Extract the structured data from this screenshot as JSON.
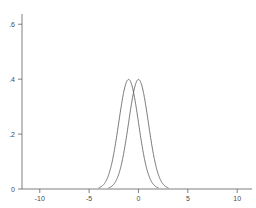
{
  "chart_data": {
    "type": "line",
    "title": "",
    "subtitle": "",
    "xlabel": "",
    "ylabel": "",
    "xlim": [
      -11.8,
      11.5
    ],
    "ylim": [
      0,
      0.63
    ],
    "grid": false,
    "legend_position": "none",
    "x_ticks": [
      -10,
      -5,
      0,
      5,
      10
    ],
    "x_tick_labels": [
      "-10",
      "-5",
      "0",
      "5",
      "10"
    ],
    "y_ticks": [
      0,
      0.2,
      0.4,
      0.6
    ],
    "y_tick_labels": [
      "0",
      ".2",
      ".4",
      ".6"
    ],
    "line_color": "#555555",
    "axis_color": "#707070",
    "background_color": "#ffffff",
    "series": [
      {
        "name": "normal density mean -1",
        "mean": -1,
        "sd": 1,
        "peak_value": 0.399,
        "x": [
          -4.0,
          -3.8,
          -3.6,
          -3.4,
          -3.2,
          -3.0,
          -2.8,
          -2.6,
          -2.4,
          -2.2,
          -2.0,
          -1.8,
          -1.6,
          -1.4,
          -1.2,
          -1.0,
          -0.8,
          -0.6,
          -0.4,
          -0.2,
          0.0,
          0.2,
          0.4,
          0.6,
          0.8,
          1.0,
          1.2,
          1.4,
          1.6,
          1.8,
          2.0
        ],
        "values": [
          0.0044,
          0.0079,
          0.0136,
          0.0224,
          0.0355,
          0.054,
          0.079,
          0.1109,
          0.1497,
          0.1942,
          0.242,
          0.2897,
          0.3332,
          0.3683,
          0.391,
          0.3989,
          0.391,
          0.3683,
          0.3332,
          0.2897,
          0.242,
          0.1942,
          0.1497,
          0.1109,
          0.079,
          0.054,
          0.0355,
          0.0224,
          0.0136,
          0.0079,
          0.0044
        ]
      },
      {
        "name": "normal density mean 0",
        "mean": 0,
        "sd": 1,
        "peak_value": 0.399,
        "x": [
          -3.0,
          -2.8,
          -2.6,
          -2.4,
          -2.2,
          -2.0,
          -1.8,
          -1.6,
          -1.4,
          -1.2,
          -1.0,
          -0.8,
          -0.6,
          -0.4,
          -0.2,
          0.0,
          0.2,
          0.4,
          0.6,
          0.8,
          1.0,
          1.2,
          1.4,
          1.6,
          1.8,
          2.0,
          2.2,
          2.4,
          2.6,
          2.8,
          3.0
        ],
        "values": [
          0.0044,
          0.0079,
          0.0136,
          0.0224,
          0.0355,
          0.054,
          0.079,
          0.1109,
          0.1497,
          0.1942,
          0.242,
          0.2897,
          0.3332,
          0.3683,
          0.391,
          0.3989,
          0.391,
          0.3683,
          0.3332,
          0.2897,
          0.242,
          0.1942,
          0.1497,
          0.1109,
          0.079,
          0.054,
          0.0355,
          0.0224,
          0.0136,
          0.0079,
          0.0044
        ]
      }
    ]
  }
}
